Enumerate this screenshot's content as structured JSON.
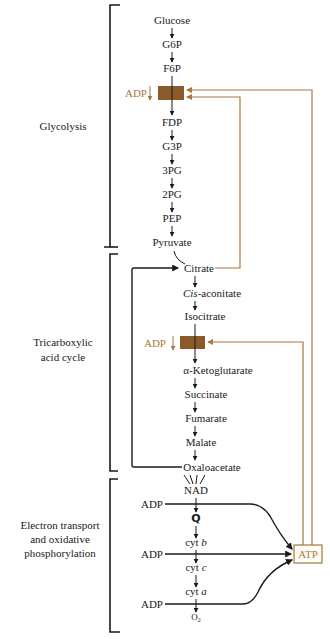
{
  "colors": {
    "ink": "#1a1a1a",
    "regulation": "#a8773e",
    "enzyme_box": "#8b5a2b",
    "background": "#ffffff"
  },
  "sections": {
    "glycolysis": "Glycolysis",
    "tca_line1": "Tricarboxylic",
    "tca_line2": "acid cycle",
    "etc_line1": "Electron transport",
    "etc_line2": "and oxidative",
    "etc_line3": "phosphorylation"
  },
  "glycolysis": {
    "nodes": [
      "Glucose",
      "G6P",
      "F6P",
      "FDP",
      "G3P",
      "3PG",
      "2PG",
      "PEP",
      "Pyruvate"
    ],
    "regulator_label": "ADP"
  },
  "tca": {
    "nodes": [
      "Citrate",
      "Cis-aconitate",
      "Isocitrate",
      "α-Ketoglutarate",
      "Succinate",
      "Fumarate",
      "Malate",
      "Oxaloacetate"
    ],
    "cis_italic": "Cis",
    "cis_rest": "-aconitate",
    "regulator_label": "ADP"
  },
  "etc": {
    "nodes": [
      "NAD",
      "Q",
      "cyt",
      "cyt",
      "cyt",
      "O"
    ],
    "cyt_b_suffix": "b",
    "cyt_c_suffix": "c",
    "cyt_a_suffix": "a",
    "o2_sub": "2",
    "adp_inputs": [
      "ADP",
      "ADP",
      "ADP"
    ],
    "product": "ATP"
  }
}
